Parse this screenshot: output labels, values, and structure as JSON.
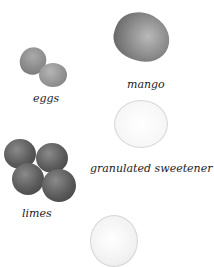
{
  "ingredients": [
    {
      "name": "eggs"
    },
    {
      "name": "mango"
    },
    {
      "name": "granulated sweetener"
    },
    {
      "name": "limes"
    }
  ],
  "colors": {
    "background": "#ffffff",
    "label_text": "#222222"
  }
}
